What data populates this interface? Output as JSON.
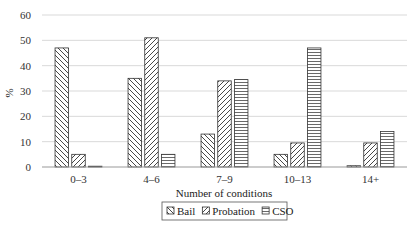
{
  "chart_data": {
    "type": "bar",
    "title": "",
    "xlabel": "Number of conditions",
    "ylabel": "%",
    "ylim": [
      0,
      60
    ],
    "yticks": [
      0,
      10,
      20,
      30,
      40,
      50,
      60
    ],
    "grid": true,
    "legend_position": "bottom",
    "categories": [
      "0–3",
      "4–6",
      "7–9",
      "10–13",
      "14+"
    ],
    "series": [
      {
        "name": "Bail",
        "pattern": "diagonal-back",
        "values": [
          47,
          35,
          13,
          5,
          0.5
        ]
      },
      {
        "name": "Probation",
        "pattern": "diagonal-forward",
        "values": [
          5,
          51,
          34,
          9.5,
          9.5
        ]
      },
      {
        "name": "CSO",
        "pattern": "horizontal",
        "values": [
          0.3,
          5,
          34.5,
          47,
          14
        ]
      }
    ]
  },
  "colors": {
    "bar_stroke": "#333333",
    "grid": "#d9d9d9",
    "axis": "#999999"
  }
}
